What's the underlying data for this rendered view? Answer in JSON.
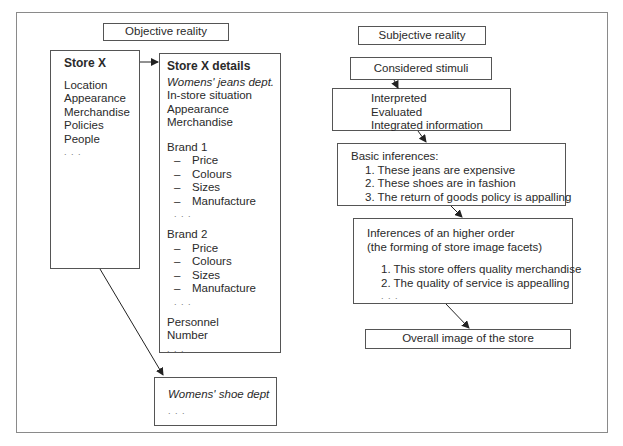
{
  "objective": {
    "heading": "Objective reality",
    "store_x": {
      "title": "Store X",
      "items": [
        "Location",
        "Appearance",
        "Merchandise",
        "Policies",
        "People"
      ],
      "ellipsis": ". . ."
    },
    "store_x_details": {
      "title": "Store X details",
      "dept": "Womens' jeans dept.",
      "items": [
        "In-store situation",
        "Appearance",
        "Merchandise"
      ],
      "brand1": {
        "label": "Brand 1",
        "attributes": [
          "Price",
          "Colours",
          "Sizes",
          "Manufacture"
        ],
        "ellipsis": ". . ."
      },
      "brand2": {
        "label": "Brand 2",
        "attributes": [
          "Price",
          "Colours",
          "Sizes",
          "Manufacture"
        ],
        "ellipsis": ". . ."
      },
      "personnel": [
        "Personnel",
        "Number"
      ],
      "ellipsis": ". . ."
    },
    "shoe_dept": {
      "title": "Womens' shoe dept",
      "ellipsis": ". . ."
    }
  },
  "subjective": {
    "heading": "Subjective reality",
    "considered": "Considered stimuli",
    "processing": [
      "Interpreted",
      "Evaluated",
      "Integrated information"
    ],
    "basic": {
      "title": "Basic inferences:",
      "items": [
        "1. These jeans are expensive",
        "2. These shoes are in fashion",
        "3. The return of goods policy is appalling"
      ]
    },
    "higher": {
      "title_line1": "Inferences of an higher order",
      "title_line2": "(the forming of store image facets)",
      "items": [
        "1. This store offers quality merchandise",
        "2. The quality of service is appealling"
      ],
      "ellipsis": ". . ."
    },
    "overall": "Overall image of the store"
  },
  "dash": "–"
}
